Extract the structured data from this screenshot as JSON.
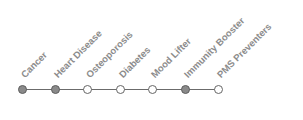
{
  "timeline": {
    "colors": {
      "filled": "#8a8a8a",
      "empty": "#ffffff",
      "line": "#6b6b6b",
      "label": "#8c8c8c"
    },
    "items": [
      {
        "label": "Cancer",
        "filled": true
      },
      {
        "label": "Heart Disease",
        "filled": true
      },
      {
        "label": "Osteoporosis",
        "filled": false
      },
      {
        "label": "Diabetes",
        "filled": false
      },
      {
        "label": "Mood Lifter",
        "filled": false
      },
      {
        "label": "Immunity Booster",
        "filled": true
      },
      {
        "label": "PMS Preventers",
        "filled": false
      }
    ]
  }
}
